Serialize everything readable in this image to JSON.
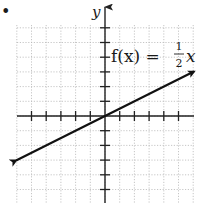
{
  "bullet": "•",
  "labels": {
    "y_axis": "y",
    "function_lhs": "f(x) =",
    "fraction_num": "1",
    "fraction_den": "2",
    "function_var": "x"
  },
  "colors": {
    "axis": "#222222",
    "line": "#111111",
    "grid": "#b8b8b8",
    "background": "#ffffff"
  },
  "chart_data": {
    "type": "line",
    "xlabel": "",
    "ylabel": "y",
    "xlim": [
      -6,
      6
    ],
    "ylim": [
      -6,
      7
    ],
    "grid": true,
    "grid_style": "dotted",
    "x_ticks": [
      -5,
      -4,
      -3,
      -2,
      -1,
      1,
      2,
      3,
      4,
      5
    ],
    "y_ticks": [
      -5,
      -4,
      -3,
      -2,
      -1,
      1,
      2,
      3,
      4,
      5,
      6
    ],
    "tick_labels_shown": false,
    "series": [
      {
        "name": "f(x) = 1/2 x",
        "slope": 0.5,
        "intercept": 0,
        "x": [
          -6,
          6
        ],
        "y": [
          -3,
          3
        ],
        "arrows": "both"
      }
    ],
    "annotations": [
      {
        "text": "f(x) = 1/2 x",
        "x": 0.3,
        "y": 4.7
      }
    ]
  }
}
